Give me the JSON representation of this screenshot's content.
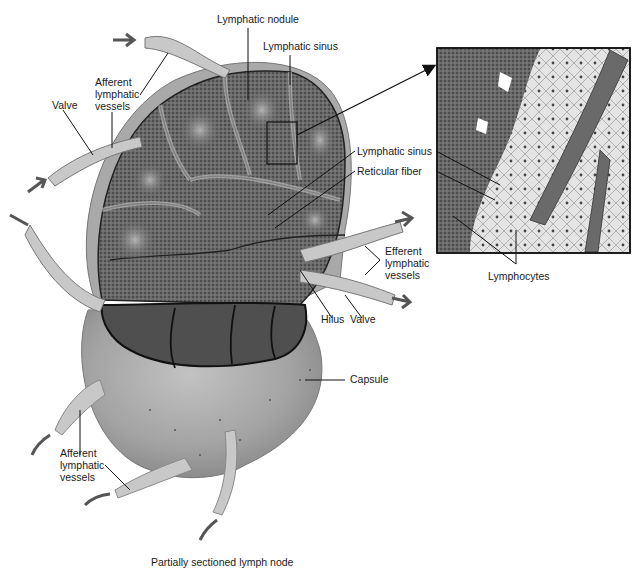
{
  "figure": {
    "caption": "Partially sectioned lymph node",
    "colors": {
      "capsule": "#9a9a9a",
      "capsule_light": "#c4c4c4",
      "nodule_dark": "#5a5a5a",
      "nodule_light": "#a8a8a8",
      "vessel": "#c8c8c8",
      "line": "#111111",
      "inset_bg": "#d6d6d6"
    }
  },
  "labels": {
    "lymphatic_nodule": "Lymphatic nodule",
    "lymphatic_sinus_top": "Lymphatic sinus",
    "afferent_top": [
      "Afferent",
      "lymphatic",
      "vessels"
    ],
    "valve_left": "Valve",
    "lymphatic_sinus_mid": "Lymphatic sinus",
    "reticular_fiber": "Reticular fiber",
    "efferent": [
      "Efferent",
      "lymphatic",
      "vessels"
    ],
    "lymphocytes": "Lymphocytes",
    "hilus": "Hilus",
    "valve_bottom": "Valve",
    "capsule": "Capsule",
    "afferent_bottom": [
      "Afferent",
      "lymphatic",
      "vessels"
    ]
  }
}
